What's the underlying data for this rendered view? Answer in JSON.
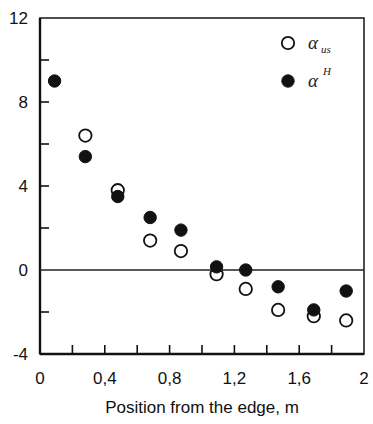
{
  "chart_data": {
    "type": "scatter",
    "title": "",
    "xlabel": "Position from the edge, m",
    "ylabel": "",
    "xlim": [
      0,
      2
    ],
    "ylim": [
      -4,
      12
    ],
    "x_ticks": [
      "0",
      "0,4",
      "0,8",
      "1,2",
      "1,6",
      "2"
    ],
    "x_tick_values": [
      0,
      0.4,
      0.8,
      1.2,
      1.6,
      2
    ],
    "x_minor_step": 0.2,
    "y_ticks": [
      "-4",
      "0",
      "4",
      "8",
      "12"
    ],
    "y_tick_values": [
      -4,
      0,
      4,
      8,
      12
    ],
    "y_minor_step": 2,
    "grid": false,
    "zero_line": true,
    "legend_position": "upper right",
    "series": [
      {
        "name": "α_us",
        "legend_base": "α",
        "legend_sub": "us",
        "marker": "open-circle",
        "color": "#111111",
        "x": [
          0.28,
          0.48,
          0.68,
          0.87,
          1.09,
          1.27,
          1.47,
          1.69,
          1.89
        ],
        "y": [
          6.4,
          3.8,
          1.4,
          0.9,
          -0.2,
          -0.9,
          -1.9,
          -2.2,
          -2.4
        ]
      },
      {
        "name": "α^H",
        "legend_base": "α",
        "legend_sup": "H",
        "marker": "filled-circle",
        "color": "#111111",
        "x": [
          0.09,
          0.28,
          0.48,
          0.68,
          0.87,
          1.09,
          1.27,
          1.47,
          1.69,
          1.89
        ],
        "y": [
          9.0,
          5.4,
          3.5,
          2.5,
          1.9,
          0.15,
          0.0,
          -0.8,
          -1.9,
          -1.0
        ]
      }
    ]
  }
}
